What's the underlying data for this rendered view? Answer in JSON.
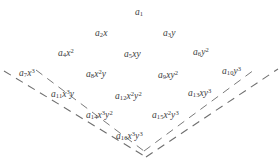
{
  "diagram": {
    "title": "",
    "type": "polynomial-term-lattice",
    "background_color": "#ffffff",
    "text_color": "#404040",
    "line_color": "#6a6a6a",
    "rows": [
      {
        "index": 1,
        "terms": [
          {
            "id": "term-1",
            "coefficient": "a",
            "subscript": "1",
            "monomial": "",
            "label": "a_1",
            "x": 135,
            "y": 8
          }
        ]
      },
      {
        "index": 2,
        "terms": [
          {
            "id": "term-2",
            "coefficient": "a",
            "subscript": "2",
            "monomial": "x",
            "label": "a_2 x",
            "x": 95,
            "y": 29
          },
          {
            "id": "term-3",
            "coefficient": "a",
            "subscript": "3",
            "monomial": "y",
            "label": "a_3 y",
            "x": 163,
            "y": 29
          }
        ]
      },
      {
        "index": 3,
        "terms": [
          {
            "id": "term-4",
            "coefficient": "a",
            "subscript": "4",
            "monomial": "x^2",
            "label": "a_4 x^2",
            "x": 58,
            "y": 48
          },
          {
            "id": "term-5",
            "coefficient": "a",
            "subscript": "5",
            "monomial": "xy",
            "label": "a_5 xy",
            "x": 124,
            "y": 50
          },
          {
            "id": "term-6",
            "coefficient": "a",
            "subscript": "6",
            "monomial": "y^2",
            "label": "a_6 y^2",
            "x": 193,
            "y": 47
          }
        ]
      },
      {
        "index": 4,
        "terms": [
          {
            "id": "term-7",
            "coefficient": "a",
            "subscript": "7",
            "monomial": "x^3",
            "label": "a_7 x^3",
            "x": 19,
            "y": 68
          },
          {
            "id": "term-8",
            "coefficient": "a",
            "subscript": "8",
            "monomial": "x^2 y",
            "label": "a_8 x^2 y",
            "x": 86,
            "y": 69
          },
          {
            "id": "term-9",
            "coefficient": "a",
            "subscript": "9",
            "monomial": "xy^2",
            "label": "a_9 xy^2",
            "x": 158,
            "y": 70
          },
          {
            "id": "term-10",
            "coefficient": "a",
            "subscript": "10",
            "monomial": "y^3",
            "label": "a_10 y^3",
            "x": 222,
            "y": 66
          }
        ]
      },
      {
        "index": 5,
        "terms": [
          {
            "id": "term-11",
            "coefficient": "a",
            "subscript": "11",
            "monomial": "x^3 y",
            "label": "a_11 x^3 y",
            "x": 51,
            "y": 89
          },
          {
            "id": "term-12",
            "coefficient": "a",
            "subscript": "12",
            "monomial": "x^2 y^2",
            "label": "a_12 x^2 y^2",
            "x": 115,
            "y": 91
          },
          {
            "id": "term-13",
            "coefficient": "a",
            "subscript": "13",
            "monomial": "xy^3",
            "label": "a_13 xy^3",
            "x": 188,
            "y": 88
          }
        ]
      },
      {
        "index": 6,
        "terms": [
          {
            "id": "term-14",
            "coefficient": "a",
            "subscript": "14",
            "monomial": "x^3 y^2",
            "label": "a_14 x^3 y^2",
            "x": 86,
            "y": 110
          },
          {
            "id": "term-15",
            "coefficient": "a",
            "subscript": "15",
            "monomial": "x^2 y^3",
            "label": "a_15 x^2 y^3",
            "x": 152,
            "y": 110
          }
        ]
      },
      {
        "index": 7,
        "terms": [
          {
            "id": "term-16",
            "coefficient": "a",
            "subscript": "16",
            "monomial": "x^3 y^3",
            "label": "a_16 x^3 y^3",
            "x": 116,
            "y": 131
          }
        ]
      }
    ],
    "dashed_boundary": {
      "description": "V-shaped dashed lines enclosing the lower terms",
      "outer_left_start": {
        "x": 4,
        "y": 71
      },
      "outer_vertex": {
        "x": 146,
        "y": 157
      },
      "outer_right_end": {
        "x": 278,
        "y": 69
      },
      "inner_vertex": {
        "x": 144,
        "y": 151
      },
      "dash_pattern": "8 6"
    }
  }
}
